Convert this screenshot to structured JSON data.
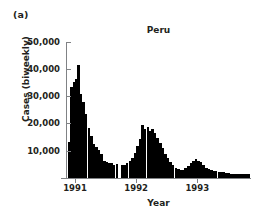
{
  "figure": {
    "panel_label": "(a)",
    "title": "Peru"
  },
  "chart_data": {
    "type": "bar",
    "title": "Peru",
    "subtitle": "",
    "xlabel": "Year",
    "ylabel": "Cases (biweekly)",
    "panel_label": "(a)",
    "bar_color": "#000000",
    "axis_color": "#808285",
    "grid": false,
    "legend": null,
    "ylim": [
      0,
      50000
    ],
    "ytick_values": [
      10000,
      20000,
      30000,
      40000,
      50000
    ],
    "ytick_labels": [
      "10,000",
      "20,000",
      "30,000",
      "40,000",
      "50,000"
    ],
    "xlim": [
      1990.86,
      1993.88
    ],
    "xtick_values": [
      1991,
      1992,
      1993
    ],
    "xtick_labels": [
      "1991",
      "1992",
      "1993"
    ],
    "x_unit": "biweekly period (year fraction)",
    "y_unit": "cases per biweekly period",
    "x": [
      1990.9,
      1990.94,
      1990.98,
      1991.02,
      1991.06,
      1991.1,
      1991.14,
      1991.18,
      1991.23,
      1991.27,
      1991.31,
      1991.35,
      1991.39,
      1991.43,
      1991.48,
      1991.52,
      1991.56,
      1991.6,
      1991.64,
      1991.69,
      1991.73,
      1991.77,
      1991.81,
      1991.85,
      1991.9,
      1991.94,
      1991.98,
      1992.02,
      1992.06,
      1992.1,
      1992.14,
      1992.19,
      1992.23,
      1992.27,
      1992.31,
      1992.35,
      1992.4,
      1992.44,
      1992.48,
      1992.52,
      1992.56,
      1992.6,
      1992.65,
      1992.69,
      1992.73,
      1992.77,
      1992.81,
      1992.86,
      1992.9,
      1992.94,
      1992.98,
      1993.02,
      1993.06,
      1993.1,
      1993.15,
      1993.19,
      1993.23,
      1993.27,
      1993.31,
      1993.36,
      1993.4,
      1993.44,
      1993.48,
      1993.52,
      1993.56,
      1993.61,
      1993.65,
      1993.69,
      1993.73,
      1993.77,
      1993.81,
      1993.85
    ],
    "values": [
      13500,
      33500,
      35500,
      36500,
      41500,
      31000,
      28000,
      23500,
      18500,
      15500,
      12500,
      11500,
      10500,
      9000,
      6500,
      6000,
      5500,
      5500,
      5000,
      5200,
      300,
      4800,
      5000,
      5500,
      6500,
      7500,
      9500,
      12000,
      14500,
      19500,
      18000,
      19000,
      17500,
      18000,
      16500,
      15000,
      13000,
      11000,
      9000,
      7500,
      6000,
      5000,
      4000,
      3500,
      3000,
      3200,
      3800,
      4500,
      5500,
      6500,
      7000,
      6500,
      6000,
      5000,
      4000,
      3500,
      3000,
      2800,
      2600,
      2500,
      2300,
      2200,
      2000,
      1900,
      1800,
      1700,
      1700,
      1600,
      1600,
      1500,
      1600,
      1500
    ],
    "features": {
      "first_wave_peak_value": 41500,
      "first_wave_peak_x": 1991.06,
      "second_wave_peak_value": 19500,
      "second_wave_peak_x": 1992.1,
      "third_wave_peak_value": 7000,
      "third_wave_peak_x": 1992.98,
      "n_bars": 72
    }
  }
}
